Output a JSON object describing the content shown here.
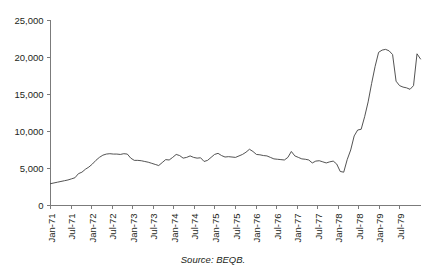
{
  "chart_data": {
    "type": "line",
    "title": "",
    "subtitle": "",
    "xlabel": "",
    "ylabel": "",
    "ylim": [
      0,
      25000
    ],
    "ytick_values": [
      0,
      5000,
      10000,
      15000,
      20000,
      25000
    ],
    "ytick_labels": [
      "0",
      "5,000",
      "10,000",
      "15,000",
      "20,000",
      "25,000"
    ],
    "xtick_labels": [
      "Jan-71",
      "Jul-71",
      "Jan-72",
      "Jul-72",
      "Jan-73",
      "Jul-73",
      "Jan-74",
      "Jul-74",
      "Jan-75",
      "Jul-75",
      "Jan-76",
      "Jul-76",
      "Jan-77",
      "Jul-77",
      "Jan-78",
      "Jul-78",
      "Jan-79",
      "Jul-79"
    ],
    "grid": false,
    "legend": false,
    "legend_position": "none",
    "annotations": [
      "Source: BEQB."
    ],
    "series": [
      {
        "name": "series-1",
        "x": [
          "Jan-71",
          "Feb-71",
          "Mar-71",
          "Apr-71",
          "May-71",
          "Jun-71",
          "Jul-71",
          "Aug-71",
          "Sep-71",
          "Oct-71",
          "Nov-71",
          "Dec-71",
          "Jan-72",
          "Feb-72",
          "Mar-72",
          "Apr-72",
          "May-72",
          "Jun-72",
          "Jul-72",
          "Aug-72",
          "Sep-72",
          "Oct-72",
          "Nov-72",
          "Dec-72",
          "Jan-73",
          "Feb-73",
          "Mar-73",
          "Apr-73",
          "May-73",
          "Jun-73",
          "Jul-73",
          "Aug-73",
          "Sep-73",
          "Oct-73",
          "Nov-73",
          "Dec-73",
          "Jan-74",
          "Feb-74",
          "Mar-74",
          "Apr-74",
          "May-74",
          "Jun-74",
          "Jul-74",
          "Aug-74",
          "Sep-74",
          "Oct-74",
          "Nov-74",
          "Dec-74",
          "Jan-75",
          "Feb-75",
          "Mar-75",
          "Apr-75",
          "May-75",
          "Jun-75",
          "Jul-75",
          "Aug-75",
          "Sep-75",
          "Oct-75",
          "Nov-75",
          "Dec-75",
          "Jan-76",
          "Feb-76",
          "Mar-76",
          "Apr-76",
          "May-76",
          "Jun-76",
          "Jul-76",
          "Aug-76",
          "Sep-76",
          "Oct-76",
          "Nov-76",
          "Dec-76",
          "Jan-77",
          "Feb-77",
          "Mar-77",
          "Apr-77",
          "May-77",
          "Jun-77",
          "Jul-77",
          "Aug-77",
          "Sep-77",
          "Oct-77",
          "Nov-77",
          "Dec-77",
          "Jan-78",
          "Feb-78",
          "Mar-78",
          "Apr-78",
          "May-78",
          "Jun-78",
          "Jul-78",
          "Aug-78",
          "Sep-78",
          "Oct-78",
          "Nov-78",
          "Dec-78",
          "Jan-79",
          "Feb-79",
          "Mar-79",
          "Apr-79",
          "May-79",
          "Jun-79",
          "Jul-79",
          "Aug-79",
          "Sep-79",
          "Oct-79",
          "Nov-79"
        ],
        "values": [
          2950,
          3050,
          3150,
          3250,
          3350,
          3450,
          3600,
          3750,
          4300,
          4500,
          4900,
          5200,
          5600,
          6100,
          6500,
          6800,
          6950,
          7000,
          6950,
          6950,
          6900,
          7000,
          6950,
          6400,
          6100,
          6100,
          6050,
          5950,
          5850,
          5700,
          5550,
          5400,
          5800,
          6200,
          6150,
          6500,
          6900,
          6750,
          6400,
          6500,
          6700,
          6500,
          6400,
          6450,
          5950,
          6100,
          6500,
          6900,
          7050,
          6750,
          6550,
          6600,
          6550,
          6500,
          6700,
          6900,
          7200,
          7600,
          7300,
          6900,
          6850,
          6750,
          6700,
          6500,
          6300,
          6250,
          6200,
          6150,
          6500,
          7300,
          6700,
          6500,
          6300,
          6250,
          6150,
          5750,
          6000,
          6050,
          5900,
          5750,
          5900,
          6000,
          5600,
          4600,
          4500,
          6200,
          7500,
          9400,
          10200,
          10300,
          12000,
          14000,
          16500,
          18800,
          20700,
          21000,
          21100,
          20900,
          20400,
          16800,
          16200,
          16000,
          15900,
          15700,
          16200,
          20500,
          19800
        ]
      }
    ]
  },
  "source": {
    "note": "Source: BEQB."
  }
}
